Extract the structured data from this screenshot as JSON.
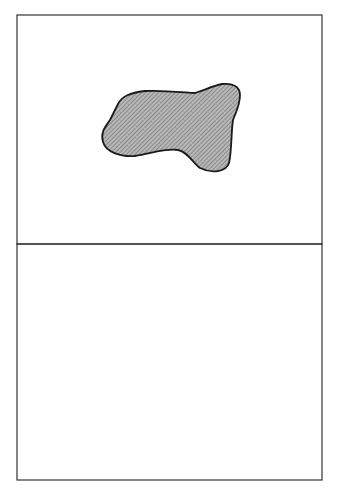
{
  "top_panel": {
    "legend_semantics": {
      "circle": "female",
      "square": "male",
      "g": "gratiosa",
      "c": "cinerea"
    },
    "circles": [
      {
        "label": "g",
        "x": 98,
        "y": 45
      },
      {
        "label": "c",
        "x": 140,
        "y": 34
      },
      {
        "label": "g",
        "x": 199,
        "y": 40
      },
      {
        "label": "c",
        "x": 232,
        "y": 40
      },
      {
        "label": "g",
        "x": 276,
        "y": 71
      },
      {
        "label": "c",
        "x": 50,
        "y": 116
      },
      {
        "label": "g",
        "x": 50,
        "y": 165
      },
      {
        "label": "c",
        "x": 284,
        "y": 150
      },
      {
        "label": "g",
        "x": 92,
        "y": 204
      },
      {
        "label": "g",
        "x": 173,
        "y": 211
      },
      {
        "label": "c",
        "x": 251,
        "y": 212
      }
    ],
    "squares_outside": [
      {
        "label": "c",
        "x": 191,
        "y": 82
      },
      {
        "label": "c",
        "x": 108,
        "y": 97
      },
      {
        "label": "c",
        "x": 245,
        "y": 119
      },
      {
        "label": "c",
        "x": 91,
        "y": 146
      },
      {
        "label": "c",
        "x": 165,
        "y": 164
      },
      {
        "label": "c",
        "x": 244,
        "y": 168
      }
    ],
    "squares_in_patch": [
      {
        "label": "g",
        "x": 153,
        "y": 108
      },
      {
        "label": "g",
        "x": 206,
        "y": 111
      },
      {
        "label": "g",
        "x": 175,
        "y": 128
      },
      {
        "label": "g",
        "x": 135,
        "y": 134
      },
      {
        "label": "g",
        "x": 206,
        "y": 145
      }
    ]
  },
  "bottom_panel": {
    "parents": {
      "female": {
        "label": "g",
        "name": "gratiosa"
      },
      "male": {
        "label": "c",
        "name": "cinerea"
      }
    },
    "f1_pairs": [
      {
        "female": "g",
        "male": "g",
        "f1_label": "F",
        "f1_sub": "1"
      },
      {
        "female": "g",
        "male": "g",
        "f1_label": "F",
        "f1_sub": "1"
      },
      {
        "female": "c",
        "male": "g",
        "f1_label": "F",
        "f1_sub": "1"
      },
      {
        "female": "g",
        "male": "c",
        "f1_label": "F",
        "f1_sub": "1"
      }
    ],
    "result_boxes": [
      {
        "all": "all",
        "label": "g"
      },
      {
        "all": "all",
        "label": "c"
      },
      {
        "all": "all",
        "label": "g"
      }
    ],
    "groups": [
      {
        "line1": "backcrosses",
        "to": "to",
        "species": "gratiosa"
      },
      {
        "line1": "backcrosses",
        "to": "to",
        "species": "cinerea"
      }
    ]
  },
  "caption": "Figure 7.7. Diphasic location of the hybrid (g) population..."
}
